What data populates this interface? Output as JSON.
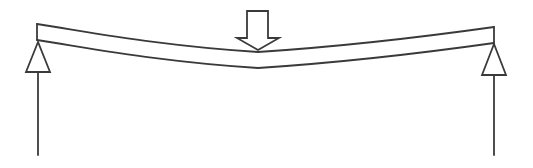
{
  "diagram": {
    "canvas": {
      "width": 533,
      "height": 168
    },
    "colors": {
      "stroke": "#3a3a3a",
      "fill": "#ffffff",
      "background": "#ffffff"
    },
    "stroke_width": 1.8,
    "beam": {
      "top_path": "M37 24 C 90 32, 160 46, 258 52 C 350 46, 430 36, 494 27",
      "bottom_path": "M37 40 C 90 48, 160 62, 258 68 C 350 62, 430 52, 494 43",
      "left_end": {
        "x": 37,
        "y_top": 24,
        "y_bottom": 40
      },
      "right_end": {
        "x": 494,
        "y_top": 27,
        "y_bottom": 43
      }
    },
    "load_arrow": {
      "label": "point-load",
      "points": "247,11 268,11 268,38 279,38 258,50 237,38 247,38"
    },
    "supports": [
      {
        "name": "left",
        "triangle": "38,42 26,72 50,72",
        "reaction_line": {
          "x": 38,
          "y1": 72,
          "y2": 155
        }
      },
      {
        "name": "right",
        "triangle": "494,44 482,75 506,75",
        "reaction_line": {
          "x": 494,
          "y1": 75,
          "y2": 155
        }
      }
    ]
  }
}
